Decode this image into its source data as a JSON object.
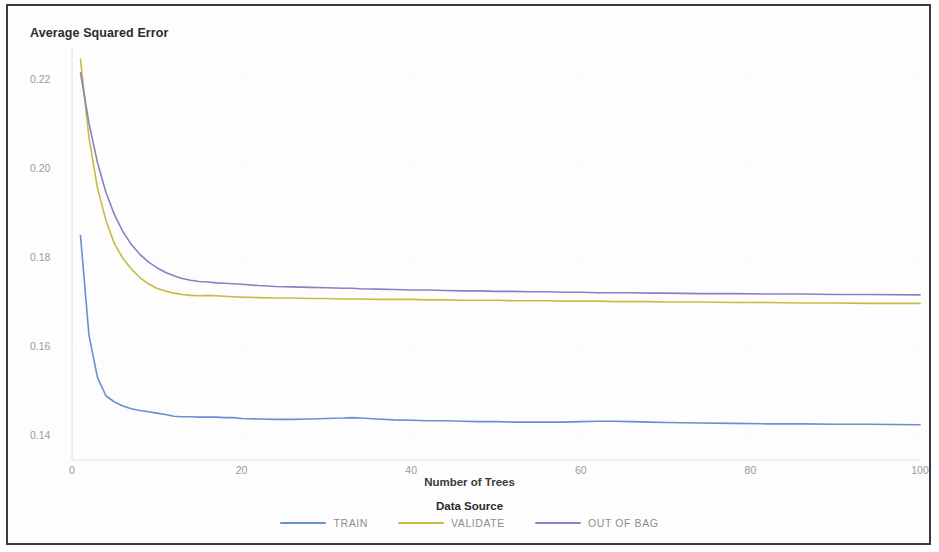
{
  "chart_data": {
    "type": "line",
    "title": "",
    "xlabel": "Number of Trees",
    "ylabel": "Average Squared Error",
    "xlim": [
      0,
      100
    ],
    "ylim": [
      0.1345,
      0.2255
    ],
    "xticks": [
      "0",
      "20",
      "40",
      "60",
      "80",
      "100"
    ],
    "xtick_values": [
      0,
      20,
      40,
      60,
      80,
      100
    ],
    "yticks": [
      "0.22",
      "0.20",
      "0.18",
      "0.16",
      "0.14"
    ],
    "ytick_values": [
      0.22,
      0.2,
      0.18,
      0.16,
      0.14
    ],
    "grid": true,
    "legend_position": "bottom",
    "legend_title": "Data Source",
    "x": [
      1,
      2,
      3,
      4,
      5,
      6,
      7,
      8,
      9,
      10,
      11,
      12,
      13,
      14,
      15,
      16,
      17,
      18,
      19,
      20,
      22,
      24,
      26,
      28,
      30,
      32,
      33,
      34,
      36,
      38,
      40,
      42,
      44,
      46,
      48,
      50,
      52,
      54,
      56,
      58,
      60,
      62,
      64,
      66,
      68,
      70,
      74,
      78,
      82,
      86,
      90,
      94,
      100
    ],
    "series": [
      {
        "name": "TRAIN",
        "color": "#6a8fd1",
        "values": [
          0.1848,
          0.1625,
          0.153,
          0.1489,
          0.1475,
          0.1466,
          0.146,
          0.1456,
          0.1453,
          0.145,
          0.1447,
          0.1443,
          0.1442,
          0.1442,
          0.1441,
          0.1441,
          0.1441,
          0.144,
          0.144,
          0.1438,
          0.1437,
          0.1436,
          0.1436,
          0.1437,
          0.1438,
          0.1439,
          0.144,
          0.1439,
          0.1437,
          0.1435,
          0.1434,
          0.1433,
          0.1433,
          0.1432,
          0.1431,
          0.1431,
          0.143,
          0.143,
          0.143,
          0.143,
          0.1431,
          0.1432,
          0.1432,
          0.1431,
          0.143,
          0.1429,
          0.1428,
          0.1427,
          0.1426,
          0.1426,
          0.1425,
          0.1425,
          0.1424
        ]
      },
      {
        "name": "VALIDATE",
        "color": "#c6bc42",
        "values": [
          0.2243,
          0.2068,
          0.1955,
          0.1882,
          0.183,
          0.1797,
          0.1773,
          0.1754,
          0.174,
          0.173,
          0.1724,
          0.1719,
          0.1716,
          0.1714,
          0.1713,
          0.1714,
          0.1713,
          0.1712,
          0.1711,
          0.171,
          0.1709,
          0.1708,
          0.1708,
          0.1707,
          0.1707,
          0.1706,
          0.1706,
          0.1706,
          0.1705,
          0.1705,
          0.1705,
          0.1704,
          0.1704,
          0.1703,
          0.1703,
          0.1703,
          0.1702,
          0.1702,
          0.1702,
          0.1701,
          0.1701,
          0.1701,
          0.17,
          0.17,
          0.17,
          0.1699,
          0.1699,
          0.1698,
          0.1698,
          0.1697,
          0.1697,
          0.1696,
          0.1696
        ]
      },
      {
        "name": "OUT OF BAG",
        "color": "#8a80c4",
        "values": [
          0.2213,
          0.21,
          0.2012,
          0.1945,
          0.1895,
          0.1857,
          0.1828,
          0.1806,
          0.1789,
          0.1776,
          0.1766,
          0.1758,
          0.1752,
          0.1748,
          0.1745,
          0.1744,
          0.1742,
          0.1741,
          0.174,
          0.1739,
          0.1736,
          0.1734,
          0.1733,
          0.1732,
          0.1731,
          0.173,
          0.173,
          0.1729,
          0.1728,
          0.1727,
          0.1726,
          0.1726,
          0.1725,
          0.1724,
          0.1724,
          0.1723,
          0.1723,
          0.1722,
          0.1722,
          0.1721,
          0.1721,
          0.172,
          0.172,
          0.172,
          0.1719,
          0.1719,
          0.1718,
          0.1718,
          0.1717,
          0.1717,
          0.1716,
          0.1716,
          0.1715
        ]
      }
    ]
  }
}
